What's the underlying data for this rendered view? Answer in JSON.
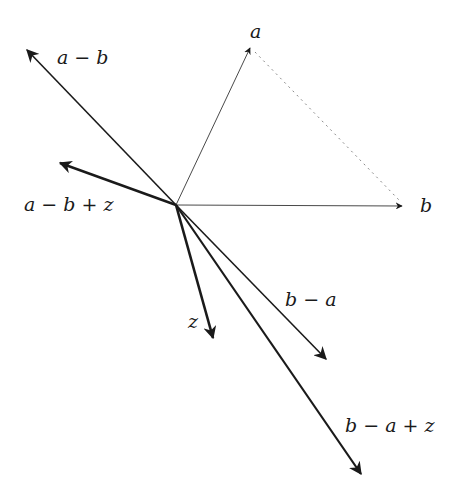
{
  "diagram": {
    "type": "vector-diagram",
    "origin": [
      176,
      205
    ],
    "vectors": [
      {
        "id": "a",
        "label": "a",
        "tip": [
          250,
          48
        ],
        "stroke": 0.8,
        "label_pos": [
          252,
          24
        ]
      },
      {
        "id": "b",
        "label": "b",
        "tip": [
          402,
          206
        ],
        "stroke": 0.8,
        "label_pos": [
          420,
          196
        ]
      },
      {
        "id": "a-b",
        "label": "a − b",
        "tip": [
          27,
          50
        ],
        "stroke": 1.6,
        "label_pos": [
          57,
          48
        ]
      },
      {
        "id": "a-b+z",
        "label": "a − b + z",
        "tip": [
          60,
          163
        ],
        "stroke": 2.4,
        "label_pos": [
          24,
          196
        ]
      },
      {
        "id": "z",
        "label": "z",
        "tip": [
          213,
          338
        ],
        "stroke": 2.6,
        "label_pos": [
          188,
          314
        ]
      },
      {
        "id": "b-a",
        "label": "b − a",
        "tip": [
          326,
          359
        ],
        "stroke": 1.6,
        "label_pos": [
          285,
          292
        ]
      },
      {
        "id": "b-a+z",
        "label": "b − a + z",
        "tip": [
          361,
          474
        ],
        "stroke": 2.2,
        "label_pos": [
          347,
          417
        ]
      }
    ],
    "dashed": {
      "from": [
        255,
        52
      ],
      "to": [
        399,
        200
      ],
      "color": "#888888"
    },
    "colors": {
      "line": "#1a1a1a",
      "background": "#ffffff"
    }
  }
}
